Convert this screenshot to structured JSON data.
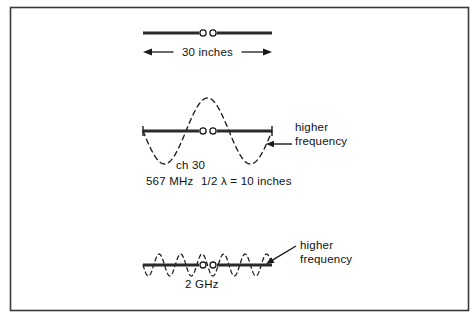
{
  "figure": {
    "title_visible": false,
    "border": {
      "color": "#3a3a3a",
      "x": 10,
      "y": 7,
      "width": 458,
      "height": 303
    },
    "colors": {
      "ink": "#111111",
      "antenna": "#2b2b2b",
      "wave_dashed": "#1a1a1a",
      "border": "#3a3a3a",
      "background": "#ffffff"
    }
  },
  "diagrams": [
    {
      "id": "top",
      "name": "half-wave-dipole-30-inches",
      "antenna": {
        "x_left": 143,
        "x_right": 272,
        "y": 33,
        "feed_gap_left_x": 203,
        "feed_gap_right_x": 213,
        "end_ticks": false
      },
      "dimension": {
        "label": "30 inches",
        "y": 52,
        "x_left": 143,
        "x_right": 272,
        "arrows": "both"
      },
      "wave": null,
      "annotations": []
    },
    {
      "id": "middle",
      "name": "ch-30-567-mhz-dipole",
      "antenna": {
        "x_left": 143,
        "x_right": 272,
        "y": 131,
        "feed_gap_left_x": 203,
        "feed_gap_right_x": 213,
        "end_ticks": true
      },
      "dimension": null,
      "wave": {
        "cycles": 1.5,
        "amplitude": 33,
        "phase": "negative-first",
        "style": "dashed"
      },
      "annotations": [
        {
          "name": "higher-frequency-callout",
          "lines": [
            "higher",
            "frequency"
          ],
          "text_x": 295,
          "text_y1": 131,
          "text_y2": 145,
          "arrow_from_x": 292,
          "arrow_from_y": 144,
          "arrow_to_x": 266,
          "arrow_to_y": 144
        }
      ],
      "texts": [
        {
          "name": "channel-label",
          "value": "ch 30",
          "x": 176,
          "y": 169
        },
        {
          "name": "frequency-label",
          "value": "567 MHz",
          "x": 146,
          "y": 185
        },
        {
          "name": "half-wavelength-label",
          "value": "1/2 λ  =  10 inches",
          "x": 201,
          "y": 185
        }
      ]
    },
    {
      "id": "bottom",
      "name": "2-ghz-dipole",
      "antenna": {
        "x_left": 143,
        "x_right": 272,
        "y": 265,
        "feed_gap_left_x": 203,
        "feed_gap_right_x": 213,
        "end_ticks": false
      },
      "dimension": null,
      "wave": {
        "cycles": 6,
        "amplitude": 11,
        "phase": "negative-first",
        "style": "dashed"
      },
      "annotations": [
        {
          "name": "higher-frequency-callout",
          "lines": [
            "higher",
            "frequency"
          ],
          "text_x": 300,
          "text_y1": 249,
          "text_y2": 263,
          "arrow_from_x": 296,
          "arrow_from_y": 246,
          "arrow_to_x": 266,
          "arrow_to_y": 264
        }
      ],
      "texts": [
        {
          "name": "frequency-label",
          "value": "2 GHz",
          "x": 185,
          "y": 288
        }
      ]
    }
  ],
  "all_text_labels": [
    "30 inches",
    "higher",
    "frequency",
    "ch 30",
    "567 MHz",
    "1/2 λ  =  10 inches",
    "2 GHz"
  ]
}
